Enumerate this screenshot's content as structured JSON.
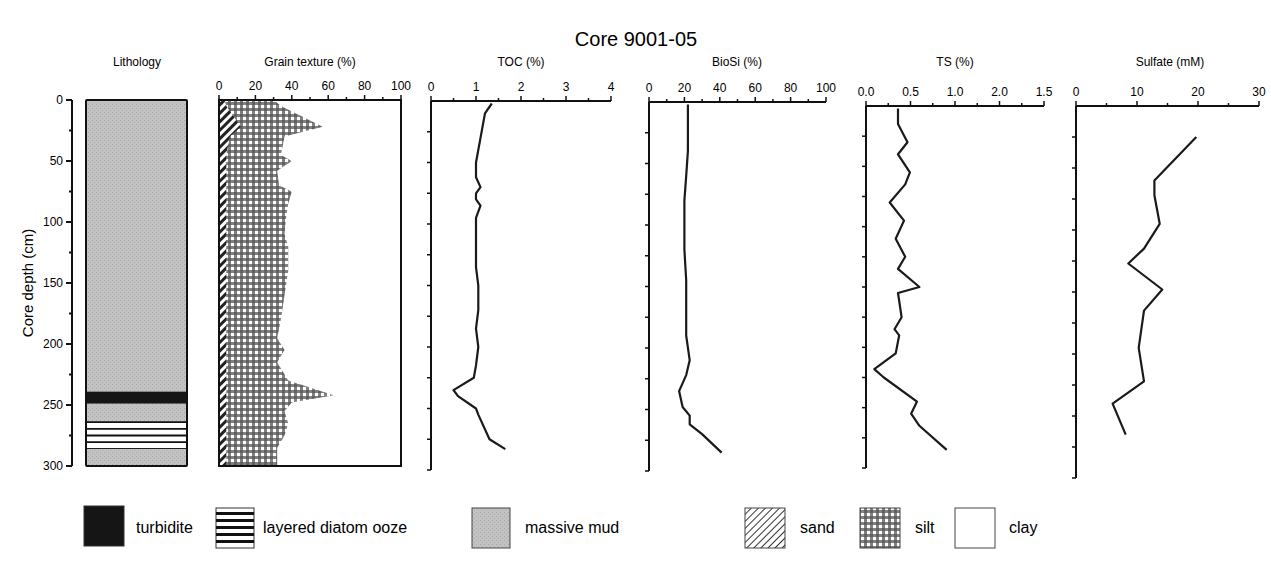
{
  "chart_data": {
    "type": "line",
    "title": "Core 9001-05",
    "ylabel": "Core depth (cm)",
    "y_axis": {
      "range": [
        0,
        300
      ],
      "inverted": true,
      "ticks": [
        0,
        50,
        100,
        150,
        200,
        250,
        300
      ]
    },
    "panels": [
      {
        "id": "lithology",
        "title": "Lithology",
        "type": "column",
        "layers": [
          {
            "top": 0,
            "bottom": 239,
            "unit": "massive mud"
          },
          {
            "top": 239,
            "bottom": 249,
            "unit": "turbidite"
          },
          {
            "top": 249,
            "bottom": 264,
            "unit": "massive mud"
          },
          {
            "top": 264,
            "bottom": 286,
            "unit": "layered diatom ooze"
          },
          {
            "top": 286,
            "bottom": 300,
            "unit": "massive mud"
          }
        ]
      },
      {
        "id": "grain",
        "title": "Grain texture (%)",
        "type": "area",
        "xlim": [
          0,
          100
        ],
        "xticks": [
          "0",
          "20",
          "40",
          "60",
          "80",
          "100"
        ],
        "depth": [
          0,
          5,
          22,
          30,
          45,
          50,
          58,
          70,
          75,
          85,
          95,
          110,
          120,
          140,
          160,
          180,
          195,
          205,
          215,
          230,
          242,
          248,
          255,
          265,
          275,
          285,
          300
        ],
        "series": [
          {
            "name": "sand",
            "values": [
              3,
              4,
              12,
              6,
              4,
              4,
              4,
              4,
              4,
              4,
              4,
              4,
              4,
              4,
              4,
              4,
              4,
              4,
              4,
              4,
              4,
              4,
              4,
              4,
              4,
              4,
              4
            ]
          },
          {
            "name": "sand+silt",
            "values": [
              30,
              34,
              57,
              36,
              34,
              40,
              32,
              33,
              40,
              38,
              37,
              36,
              38,
              38,
              36,
              34,
              32,
              36,
              32,
              38,
              63,
              40,
              36,
              38,
              36,
              32,
              32
            ]
          }
        ]
      },
      {
        "id": "toc",
        "title": "TOC (%)",
        "type": "line",
        "xlim": [
          0,
          4
        ],
        "xticks": [
          "0",
          "1",
          "2",
          "3",
          "4"
        ],
        "depth": [
          2,
          10,
          30,
          50,
          62,
          70,
          75,
          80,
          85,
          95,
          115,
          135,
          150,
          170,
          185,
          200,
          215,
          225,
          235,
          240,
          250,
          255,
          275,
          283
        ],
        "values": [
          1.35,
          1.2,
          1.1,
          1.0,
          1.0,
          1.1,
          1.0,
          1.0,
          1.1,
          1.0,
          1.0,
          1.0,
          1.05,
          1.05,
          1.0,
          1.05,
          1.0,
          0.95,
          0.5,
          0.6,
          1.0,
          1.05,
          1.3,
          1.65
        ]
      },
      {
        "id": "biosi",
        "title": "BioSi (%)",
        "type": "line",
        "xlim": [
          0,
          100
        ],
        "xticks": [
          "0",
          "20",
          "40",
          "60",
          "80",
          "100"
        ],
        "depth": [
          2,
          20,
          40,
          60,
          80,
          100,
          120,
          145,
          165,
          190,
          210,
          222,
          235,
          248,
          255,
          262,
          270,
          285
        ],
        "values": [
          22,
          22,
          22,
          21,
          20,
          20,
          20,
          21,
          21,
          21,
          23,
          21,
          17,
          19,
          23,
          23,
          30,
          41
        ]
      },
      {
        "id": "ts",
        "title": "TS (%)",
        "type": "line",
        "xlim": [
          0,
          1.5
        ],
        "xticks": [
          "0.0",
          "0.5",
          "1.0",
          "2.0",
          "1.5"
        ],
        "depth": [
          2,
          15,
          30,
          40,
          55,
          65,
          80,
          95,
          110,
          125,
          135,
          150,
          155,
          175,
          185,
          190,
          205,
          218,
          225,
          245,
          255,
          265,
          285
        ],
        "values": [
          0.27,
          0.27,
          0.35,
          0.27,
          0.37,
          0.33,
          0.2,
          0.32,
          0.25,
          0.33,
          0.27,
          0.45,
          0.27,
          0.3,
          0.24,
          0.28,
          0.25,
          0.07,
          0.15,
          0.43,
          0.38,
          0.45,
          0.68
        ]
      },
      {
        "id": "sulfate",
        "title": "Sulfate (mM)",
        "type": "line",
        "xlim": [
          0,
          35
        ],
        "xticks": [
          "0",
          "10",
          "20",
          "30"
        ],
        "depth": [
          25,
          60,
          72,
          95,
          115,
          127,
          148,
          165,
          195,
          222,
          240,
          265
        ],
        "values": [
          23,
          15,
          15,
          16,
          13,
          10,
          16.5,
          13,
          12,
          13,
          7,
          9.5
        ]
      }
    ],
    "legend": [
      {
        "label": "turbidite",
        "pattern": "solid-black"
      },
      {
        "label": "layered diatom ooze",
        "pattern": "horizontal-stripes"
      },
      {
        "label": "massive mud",
        "pattern": "gray"
      },
      {
        "label": "sand",
        "pattern": "diagonal-hatch"
      },
      {
        "label": "silt",
        "pattern": "checker"
      },
      {
        "label": "clay",
        "pattern": "white"
      }
    ],
    "colors": {
      "massive_mud": "#bcbcbc",
      "turbidite": "#151515",
      "line": "#1a1a1a"
    }
  }
}
